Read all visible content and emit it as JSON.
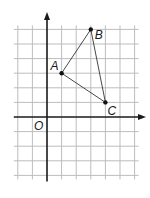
{
  "diagram": {
    "type": "coordinate-grid-triangle",
    "origin_label": "O",
    "grid": {
      "x_min": -2,
      "x_max": 6,
      "y_min": -4,
      "y_max": 7,
      "unit_px": 14.6,
      "origin_px": [
        47,
        117
      ],
      "line_color": "#bdbdbd",
      "axis_color": "#1a1a1a"
    },
    "points": [
      {
        "label": "A",
        "x": 1,
        "y": 3
      },
      {
        "label": "B",
        "x": 3,
        "y": 6
      },
      {
        "label": "C",
        "x": 4,
        "y": 1
      }
    ],
    "triangle_color": "#333333"
  }
}
